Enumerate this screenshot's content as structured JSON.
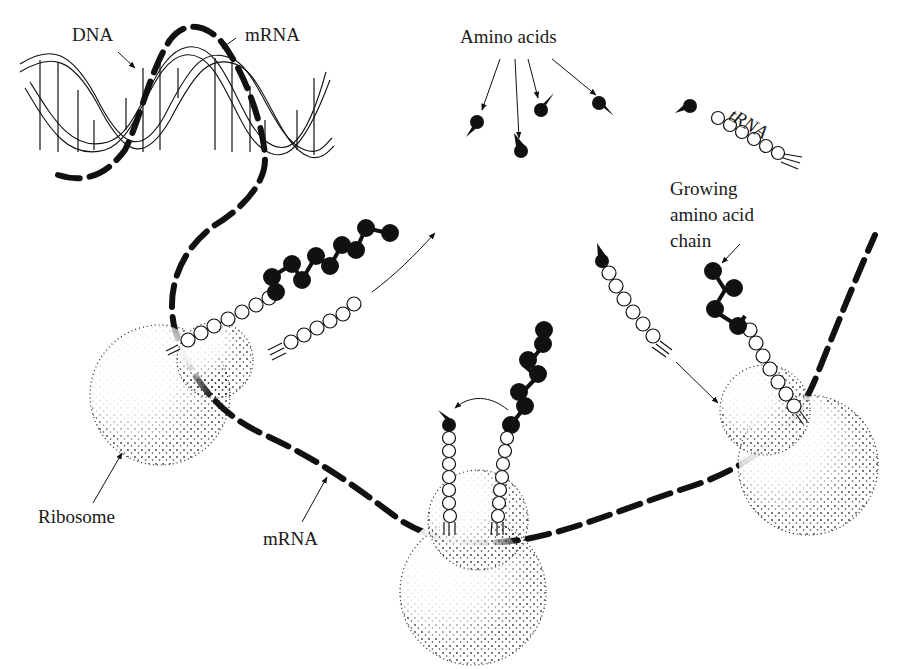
{
  "diagram": {
    "labels": {
      "dna": "DNA",
      "mrna_top": "mRNA",
      "amino_acids": "Amino acids",
      "trna": "tRNA",
      "growing_chain_line1": "Growing",
      "growing_chain_line2": "amino acid",
      "growing_chain_line3": "chain",
      "ribosome": "Ribosome",
      "mrna_bottom": "mRNA"
    },
    "colors": {
      "ink": "#111111",
      "background": "#ffffff"
    },
    "nodes": [
      {
        "id": "dna",
        "label": "DNA",
        "shape": "double-helix"
      },
      {
        "id": "mrna",
        "label": "mRNA",
        "shape": "dashed-strand"
      },
      {
        "id": "amino-acids",
        "label": "Amino acids",
        "count": 5,
        "shape": "filled-teardrop"
      },
      {
        "id": "trna",
        "label": "tRNA",
        "shape": "bead-chain"
      },
      {
        "id": "ribosome-1",
        "label": "Ribosome",
        "shape": "stippled-circles"
      },
      {
        "id": "ribosome-2",
        "shape": "stippled-circles"
      },
      {
        "id": "ribosome-3",
        "shape": "stippled-circles"
      },
      {
        "id": "growing-chain",
        "label": "Growing amino acid chain",
        "shape": "filled-bead-chain"
      }
    ]
  }
}
